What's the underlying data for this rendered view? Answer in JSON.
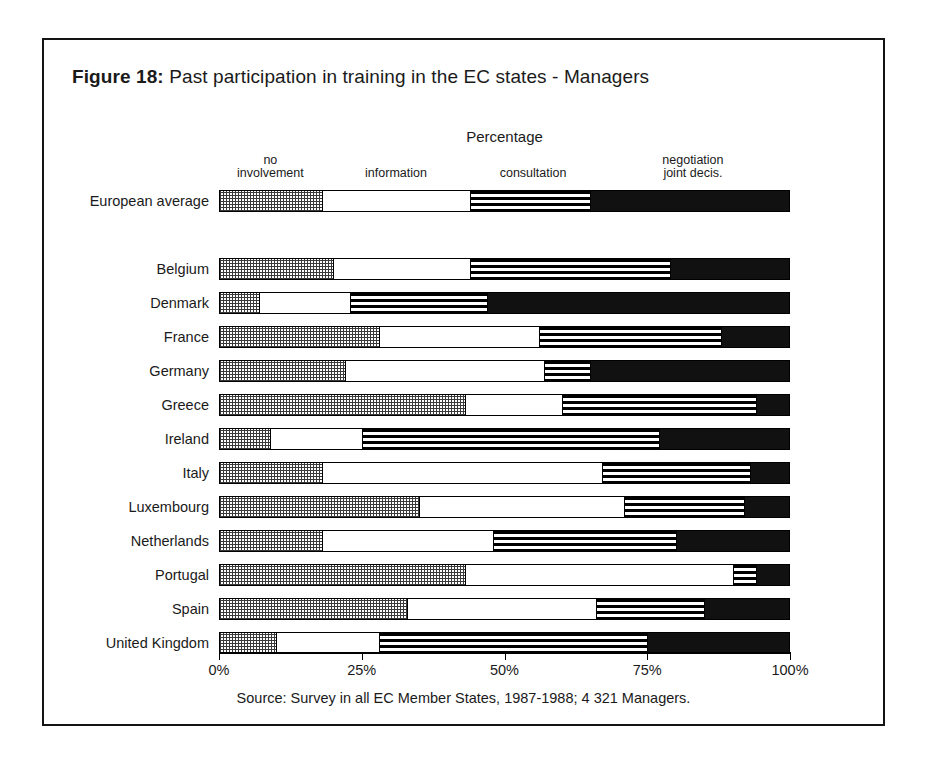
{
  "figure": {
    "label": "Figure 18:",
    "caption": "Past participation in training in the EC states - Managers",
    "axis_title": "Percentage",
    "source": "Source: Survey in all EC Member States, 1987-1988; 4 321 Managers."
  },
  "axis": {
    "ticks": [
      "0%",
      "25%",
      "50%",
      "75%",
      "100%"
    ],
    "tick_values": [
      0,
      25,
      50,
      75,
      100
    ],
    "min": 0,
    "max": 100
  },
  "legend": [
    {
      "key": "no_involvement",
      "label": "no\ninvolvement",
      "pattern": "checker-grey",
      "color": "#bdbdbd",
      "center_pct": 9
    },
    {
      "key": "information",
      "label": "information",
      "pattern": "white",
      "color": "#ffffff",
      "center_pct": 31
    },
    {
      "key": "consultation",
      "label": "consultation",
      "pattern": "horizontal-stripes",
      "color": "#000000",
      "center_pct": 55
    },
    {
      "key": "negotiation",
      "label": "negotiation\njoint decis.",
      "pattern": "solid-black",
      "color": "#111111",
      "center_pct": 83
    }
  ],
  "chart_data": {
    "type": "bar",
    "orientation": "horizontal",
    "stacked": true,
    "normalized": true,
    "title": "Past participation in training in the EC states - Managers",
    "xlabel": "Percentage",
    "ylabel": "",
    "xlim": [
      0,
      100
    ],
    "grid": false,
    "legend_position": "top",
    "series": [
      {
        "name": "no involvement",
        "values": [
          18,
          20,
          7,
          28,
          22,
          43,
          9,
          18,
          35,
          18,
          43,
          33,
          10
        ]
      },
      {
        "name": "information",
        "values": [
          26,
          24,
          16,
          28,
          35,
          17,
          16,
          49,
          36,
          30,
          47,
          33,
          18
        ]
      },
      {
        "name": "consultation",
        "values": [
          21,
          35,
          24,
          32,
          8,
          34,
          52,
          26,
          21,
          32,
          4,
          19,
          47
        ]
      },
      {
        "name": "negotiation joint decis.",
        "values": [
          35,
          21,
          53,
          12,
          35,
          6,
          23,
          7,
          8,
          20,
          6,
          15,
          25
        ]
      }
    ],
    "categories": [
      "European average",
      "Belgium",
      "Denmark",
      "France",
      "Germany",
      "Greece",
      "Ireland",
      "Italy",
      "Luxembourg",
      "Netherlands",
      "Portugal",
      "Spain",
      "United Kingdom"
    ],
    "rows": [
      {
        "label": "European average",
        "group": "average",
        "no_involvement": 18,
        "information": 26,
        "consultation": 21,
        "negotiation": 35
      },
      {
        "label": "Belgium",
        "group": "country",
        "no_involvement": 20,
        "information": 24,
        "consultation": 35,
        "negotiation": 21
      },
      {
        "label": "Denmark",
        "group": "country",
        "no_involvement": 7,
        "information": 16,
        "consultation": 24,
        "negotiation": 53
      },
      {
        "label": "France",
        "group": "country",
        "no_involvement": 28,
        "information": 28,
        "consultation": 32,
        "negotiation": 12
      },
      {
        "label": "Germany",
        "group": "country",
        "no_involvement": 22,
        "information": 35,
        "consultation": 8,
        "negotiation": 35
      },
      {
        "label": "Greece",
        "group": "country",
        "no_involvement": 43,
        "information": 17,
        "consultation": 34,
        "negotiation": 6
      },
      {
        "label": "Ireland",
        "group": "country",
        "no_involvement": 9,
        "information": 16,
        "consultation": 52,
        "negotiation": 23
      },
      {
        "label": "Italy",
        "group": "country",
        "no_involvement": 18,
        "information": 49,
        "consultation": 26,
        "negotiation": 7
      },
      {
        "label": "Luxembourg",
        "group": "country",
        "no_involvement": 35,
        "information": 36,
        "consultation": 21,
        "negotiation": 8
      },
      {
        "label": "Netherlands",
        "group": "country",
        "no_involvement": 18,
        "information": 30,
        "consultation": 32,
        "negotiation": 20
      },
      {
        "label": "Portugal",
        "group": "country",
        "no_involvement": 43,
        "information": 47,
        "consultation": 4,
        "negotiation": 6
      },
      {
        "label": "Spain",
        "group": "country",
        "no_involvement": 33,
        "information": 33,
        "consultation": 19,
        "negotiation": 15
      },
      {
        "label": "United Kingdom",
        "group": "country",
        "no_involvement": 10,
        "information": 18,
        "consultation": 47,
        "negotiation": 25
      }
    ]
  }
}
